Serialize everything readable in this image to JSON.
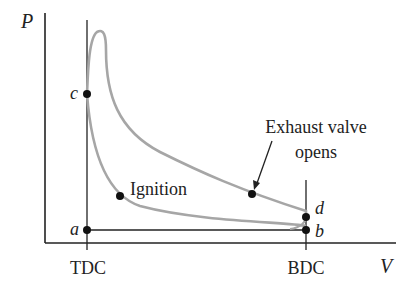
{
  "diagram": {
    "axes": {
      "y_label": "P",
      "x_label": "V",
      "x_ticks": [
        "TDC",
        "BDC"
      ]
    },
    "points": {
      "a": "a",
      "b": "b",
      "c": "c",
      "d": "d"
    },
    "annotations": {
      "ignition": "Ignition",
      "exhaust_line1": "Exhaust valve",
      "exhaust_line2": "opens"
    },
    "colors": {
      "curve": "#a6a6a6",
      "axis": "#222222",
      "point": "#111111"
    }
  }
}
